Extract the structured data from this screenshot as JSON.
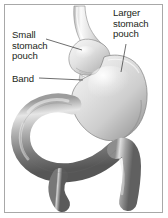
{
  "figure": {
    "background_color": "#ffffff",
    "frame_color": "#a8a8a8",
    "text_color": "#231f20",
    "style": "grayscale medical line-and-wash illustration"
  },
  "labels": {
    "small_pouch": "Small\nstomach\npouch",
    "band": "Band",
    "large_pouch": "Larger\nstomach\npouch"
  },
  "anatomy": {
    "esophagus": "esophagus",
    "small_pouch": "small stomach pouch",
    "band": "adjustable gastric band",
    "large_pouch": "larger stomach pouch",
    "intestine": "duodenum and small intestine"
  },
  "palette": {
    "stomach_light": "#e8e8e8",
    "stomach_mid": "#c9c9c9",
    "stomach_shadow": "#9a9a9a",
    "intestine_light": "#d2d2d2",
    "intestine_mid": "#8e8e8e",
    "intestine_dark": "#5f5f5f",
    "outline": "#6b6b6b",
    "leader_line": "#3a3a3a"
  }
}
